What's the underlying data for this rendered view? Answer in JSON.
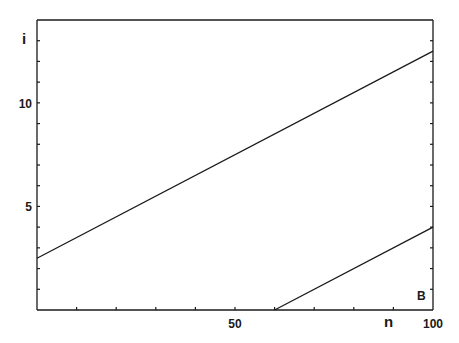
{
  "chart_data": {
    "type": "line",
    "title": "",
    "panel_label": "B",
    "xlabel": "n",
    "ylabel": "i",
    "xlim": [
      0,
      100
    ],
    "ylim": [
      0,
      14
    ],
    "x_tick_labels": [
      "50",
      "100"
    ],
    "x_tick_values": [
      50,
      100
    ],
    "x_minor_tick_step": 10,
    "y_tick_labels": [
      "5",
      "10"
    ],
    "y_tick_values": [
      5,
      10
    ],
    "y_minor_tick_step": 1,
    "grid": false,
    "legend": null,
    "series": [
      {
        "name": "upper line",
        "x": [
          0,
          100
        ],
        "y": [
          2.5,
          12.5
        ]
      },
      {
        "name": "lower line",
        "x": [
          60,
          100
        ],
        "y": [
          0,
          4
        ]
      }
    ],
    "colors": {
      "line": "#1a1a1a",
      "background": "#ffffff"
    }
  }
}
